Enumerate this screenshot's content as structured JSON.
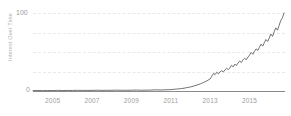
{
  "chart_data": {
    "type": "line",
    "title": "",
    "subtitle": "",
    "xlabel": "",
    "ylabel": "Interest Over Time",
    "ylim": [
      0,
      100
    ],
    "xlim": [
      2004,
      2016.8
    ],
    "grid": true,
    "legend": false,
    "legend_position": "none",
    "line_color": "#5a5a5a",
    "grid_color": "#e9e9e9",
    "axis_color": "#8a8a8a",
    "tick_text_color": "#9d9d9d",
    "y_ticks": [
      {
        "value": 100,
        "label": "100"
      },
      {
        "value": 75,
        "label": ""
      },
      {
        "value": 50,
        "label": ""
      },
      {
        "value": 25,
        "label": ""
      },
      {
        "value": 0,
        "label": "0"
      }
    ],
    "x_ticks": [
      {
        "value": 2005,
        "label": "2005"
      },
      {
        "value": 2007,
        "label": "2007"
      },
      {
        "value": 2009,
        "label": "2009"
      },
      {
        "value": 2011,
        "label": "2011"
      },
      {
        "value": 2013,
        "label": "2013"
      },
      {
        "value": 2015,
        "label": "2015"
      }
    ],
    "series": [
      {
        "name": "Interest Over Time",
        "x": [
          2004.0,
          2004.25,
          2004.5,
          2004.75,
          2005.0,
          2005.25,
          2005.5,
          2005.75,
          2006.0,
          2006.25,
          2006.5,
          2006.75,
          2007.0,
          2007.25,
          2007.5,
          2007.75,
          2008.0,
          2008.25,
          2008.5,
          2008.75,
          2009.0,
          2009.25,
          2009.5,
          2009.75,
          2010.0,
          2010.25,
          2010.5,
          2010.75,
          2011.0,
          2011.17,
          2011.33,
          2011.5,
          2011.67,
          2011.83,
          2012.0,
          2012.17,
          2012.33,
          2012.5,
          2012.67,
          2012.83,
          2013.0,
          2013.08,
          2013.17,
          2013.25,
          2013.33,
          2013.42,
          2013.5,
          2013.58,
          2013.67,
          2013.75,
          2013.83,
          2013.92,
          2014.0,
          2014.08,
          2014.17,
          2014.25,
          2014.33,
          2014.42,
          2014.5,
          2014.58,
          2014.67,
          2014.75,
          2014.83,
          2014.92,
          2015.0,
          2015.08,
          2015.17,
          2015.25,
          2015.33,
          2015.42,
          2015.5,
          2015.58,
          2015.67,
          2015.75,
          2015.83,
          2015.92,
          2016.0,
          2016.08,
          2016.17,
          2016.25,
          2016.33,
          2016.42,
          2016.5,
          2016.58,
          2016.67,
          2016.75
        ],
        "y": [
          0.5,
          0.6,
          0.5,
          0.6,
          0.6,
          0.8,
          0.6,
          0.7,
          0.7,
          0.9,
          0.7,
          0.8,
          0.8,
          1.0,
          0.8,
          0.9,
          0.9,
          1.1,
          0.9,
          1.0,
          1.0,
          1.2,
          1.0,
          1.1,
          1.2,
          1.5,
          1.3,
          1.6,
          1.8,
          2.2,
          2.6,
          3.0,
          3.6,
          4.4,
          5.2,
          6.4,
          7.6,
          9.2,
          11.0,
          13.0,
          15.5,
          19.0,
          22.5,
          21.0,
          24.0,
          22.0,
          24.5,
          26.0,
          24.5,
          27.0,
          29.0,
          27.5,
          29.5,
          33.0,
          31.0,
          34.5,
          32.5,
          36.0,
          38.5,
          36.5,
          40.0,
          42.0,
          40.0,
          43.5,
          46.0,
          49.5,
          47.0,
          51.0,
          54.0,
          52.0,
          56.0,
          60.0,
          57.5,
          62.0,
          66.0,
          63.5,
          68.0,
          73.0,
          70.0,
          76.0,
          81.0,
          78.0,
          84.0,
          90.0,
          94.0,
          100.0
        ]
      }
    ]
  },
  "axis": {
    "y_top_label": "100",
    "y_bottom_label": "0",
    "y_title": "Interest Over Time"
  }
}
